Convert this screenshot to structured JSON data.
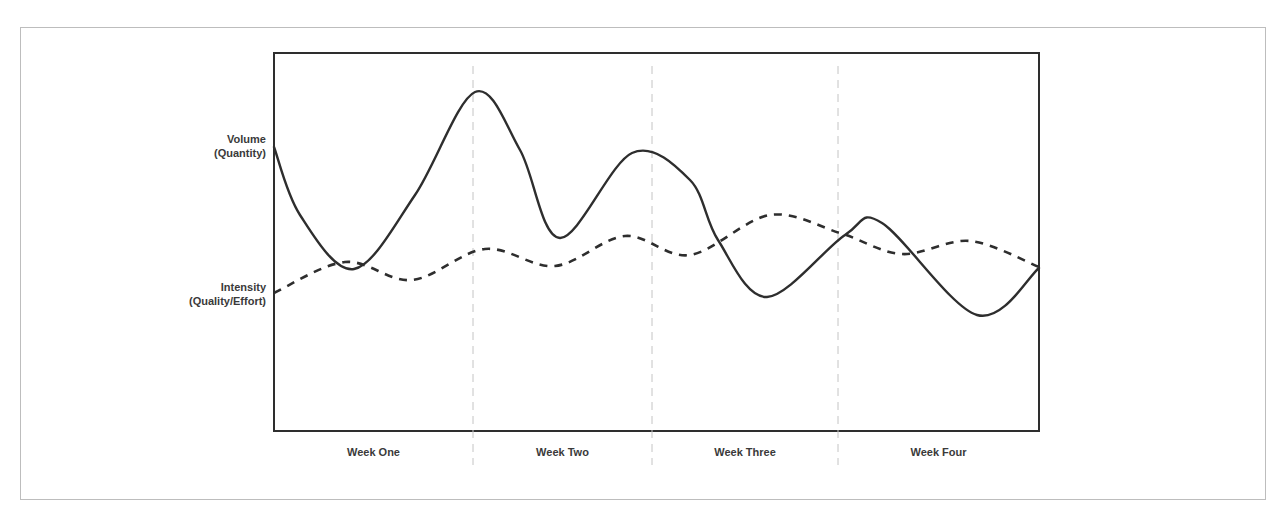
{
  "chart_data": {
    "type": "line",
    "title": "",
    "xlabel": "",
    "ylabel": "",
    "categories": [
      "Week One",
      "Week Two",
      "Week Three",
      "Week Four"
    ],
    "y_labels": [
      {
        "line1": "Volume",
        "line2": "(Quantity)"
      },
      {
        "line1": "Intensity",
        "line2": "(Quality/Effort)"
      }
    ],
    "grid": {
      "vertical_dividers": "dashed",
      "horizontal": false
    },
    "series": [
      {
        "name": "Volume (Quantity)",
        "style": "solid",
        "points": [
          [
            274,
            147
          ],
          [
            300,
            215
          ],
          [
            354,
            269
          ],
          [
            415,
            195
          ],
          [
            475,
            92
          ],
          [
            520,
            150
          ],
          [
            560,
            238
          ],
          [
            632,
            153
          ],
          [
            690,
            180
          ],
          [
            718,
            240
          ],
          [
            767,
            297
          ],
          [
            845,
            235
          ],
          [
            882,
            223
          ],
          [
            977,
            315
          ],
          [
            1039,
            268
          ]
        ]
      },
      {
        "name": "Intensity (Quality/Effort)",
        "style": "dashed",
        "points": [
          [
            274,
            293
          ],
          [
            345,
            262
          ],
          [
            412,
            280
          ],
          [
            485,
            249
          ],
          [
            555,
            266
          ],
          [
            625,
            236
          ],
          [
            690,
            255
          ],
          [
            770,
            215
          ],
          [
            840,
            233
          ],
          [
            902,
            254
          ],
          [
            970,
            241
          ],
          [
            1039,
            267
          ]
        ]
      }
    ],
    "colors": {
      "line": "#2e2e2e",
      "frame": "#bdbdbd",
      "divider": "#c4c4c4",
      "text": "#3a3a3a"
    }
  }
}
